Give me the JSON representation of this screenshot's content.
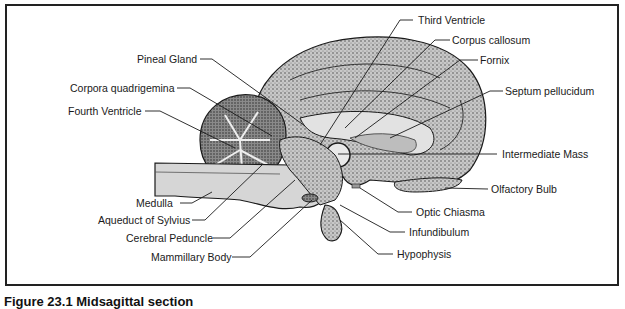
{
  "figure": {
    "caption": "Figure 23.1  Midsagittal section"
  },
  "labels_left": [
    {
      "id": "pineal-gland",
      "text": "Pineal Gland"
    },
    {
      "id": "corpora-quadrigemina",
      "text": "Corpora quadrigemina"
    },
    {
      "id": "fourth-ventricle",
      "text": "Fourth Ventricle"
    },
    {
      "id": "medulla",
      "text": "Medulla"
    },
    {
      "id": "aqueduct-of-sylvius",
      "text": "Aqueduct of Sylvius"
    },
    {
      "id": "cerebral-peduncle",
      "text": "Cerebral Peduncle"
    },
    {
      "id": "mammillary-body",
      "text": "Mammillary Body"
    }
  ],
  "labels_right": [
    {
      "id": "third-ventricle",
      "text": "Third Ventricle"
    },
    {
      "id": "corpus-callosum",
      "text": "Corpus callosum"
    },
    {
      "id": "fornix",
      "text": "Fornix"
    },
    {
      "id": "septum-pellucidum",
      "text": "Septum pellucidum"
    },
    {
      "id": "intermediate-mass",
      "text": "Intermediate Mass"
    },
    {
      "id": "olfactory-bulb",
      "text": "Olfactory Bulb"
    },
    {
      "id": "optic-chiasma",
      "text": "Optic Chiasma"
    },
    {
      "id": "infundibulum",
      "text": "Infundibulum"
    },
    {
      "id": "hypophysis",
      "text": "Hypophysis"
    }
  ],
  "colors": {
    "ink": "#1a1a1a",
    "stipple": "#7a7a7a",
    "tissue_light": "#d9d9d9",
    "frame": "#222222"
  }
}
